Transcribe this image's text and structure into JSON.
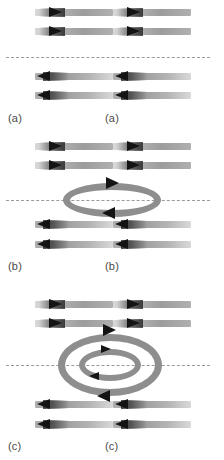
{
  "figure": {
    "background_color": "#ffffff",
    "arrow_tail_color": "#a8a8a8",
    "arrow_head_color": "#141414",
    "ring_color": "#8e8e8e",
    "dash_line_color": "#9a9a9a",
    "label_color": "#4a4a4a"
  },
  "panels": [
    {
      "id": "panel-a",
      "left_label": "(a)",
      "center_label": "(a)",
      "top_rows": [
        {
          "direction": "right",
          "arrows": [
            "right",
            "right"
          ]
        },
        {
          "direction": "right",
          "arrows": [
            "right",
            "right"
          ]
        }
      ],
      "bottom_rows": [
        {
          "direction": "left",
          "arrows": [
            "left",
            "left"
          ]
        },
        {
          "direction": "left",
          "arrows": [
            "left",
            "left"
          ]
        }
      ],
      "vortex_rings": 0,
      "ring_arrowheads": []
    },
    {
      "id": "panel-b",
      "left_label": "(b)",
      "center_label": "(b)",
      "top_rows": [
        {
          "direction": "right",
          "arrows": [
            "right",
            "right"
          ]
        },
        {
          "direction": "right",
          "arrows": [
            "right",
            "right"
          ]
        }
      ],
      "bottom_rows": [
        {
          "direction": "left",
          "arrows": [
            "left",
            "left"
          ]
        },
        {
          "direction": "left",
          "arrows": [
            "left",
            "left"
          ]
        }
      ],
      "vortex_rings": 1,
      "ring_arrowheads": [
        "top-right",
        "bottom-left"
      ]
    },
    {
      "id": "panel-c",
      "left_label": "(c)",
      "center_label": "(c)",
      "top_rows": [
        {
          "direction": "right",
          "arrows": [
            "right",
            "right"
          ]
        },
        {
          "direction": "right",
          "arrows": [
            "right",
            "right"
          ]
        }
      ],
      "bottom_rows": [
        {
          "direction": "left",
          "arrows": [
            "left",
            "left"
          ]
        },
        {
          "direction": "left",
          "arrows": [
            "left",
            "left"
          ]
        }
      ],
      "vortex_rings": 2,
      "ring_arrowheads": [
        "outer-top-right",
        "inner-top-right",
        "inner-bottom-left",
        "outer-bottom-left"
      ]
    }
  ]
}
